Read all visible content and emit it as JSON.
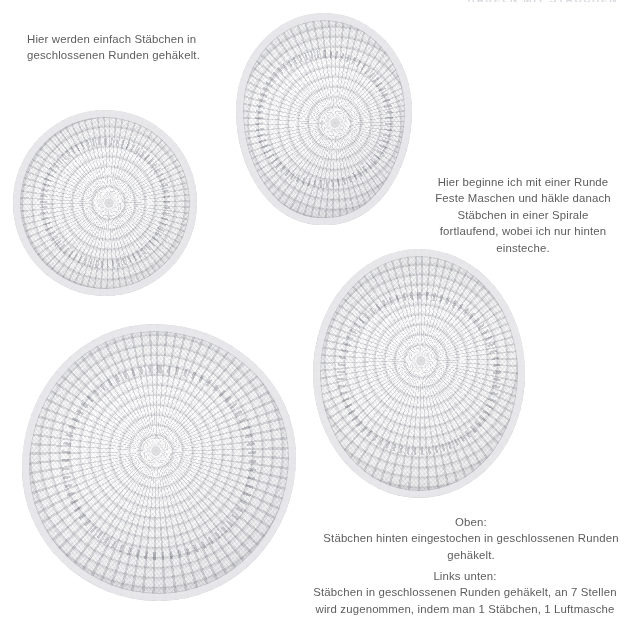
{
  "page": {
    "width": 630,
    "height": 618,
    "background_color": "#ffffff",
    "text_color": "#5c5c5c",
    "running_header": "HÄKELN MIT STÄBCHEN"
  },
  "captions": {
    "intro": "Hier werden einfach Stäbchen in\ngeschlossenen Runden gehäkelt.",
    "spiral": "Hier beginne ich mit einer Runde\nFeste Maschen und häkle danach\nStäbchen in einer Spirale\nfortlaufend, wobei ich nur hinten\neinsteche.",
    "oben": "Oben:\nStäbchen hinten eingestochen in geschlossenen Runden\ngehäkelt.",
    "links_unten": "Links unten:\nStäbchen in geschlossenen Runden gehäkelt, an 7  Stellen\nwird zugenommen, indem man 1 Stäbchen, 1 Luftmasche"
  },
  "photos": [
    {
      "id": "disc-top",
      "name": "crochet-disc-top",
      "description": "Gehäkelte Scheibe aus Stäbchen in geschlossenen Runden, hinten eingestochen",
      "yarn_color": "#f2f2f3"
    },
    {
      "id": "disc-left",
      "name": "crochet-disc-left",
      "description": "Gehäkelte Scheibe aus Stäbchen in geschlossenen Runden",
      "yarn_color": "#f4f4f5"
    },
    {
      "id": "disc-right",
      "name": "crochet-disc-right",
      "description": "Gehäkelte Scheibe, Runde Feste Maschen dann Stäbchen in Spirale",
      "yarn_color": "#f1f1f2"
    },
    {
      "id": "disc-bottom",
      "name": "crochet-disc-bottom-left",
      "description": "Gehäkelte Scheibe mit Zunahmen an 7 Stellen",
      "yarn_color": "#eeeeef"
    }
  ]
}
